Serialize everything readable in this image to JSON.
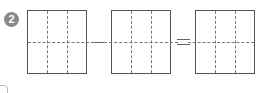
{
  "problem": {
    "number": "2",
    "operators": [
      "minus",
      "equals"
    ],
    "boxes": [
      {
        "columns": 3,
        "rows": 2
      },
      {
        "columns": 3,
        "rows": 2
      },
      {
        "columns": 3,
        "rows": 2
      }
    ]
  },
  "colors": {
    "badge": "#8a8a8a",
    "border": "#555555",
    "dashed": "#777777"
  }
}
